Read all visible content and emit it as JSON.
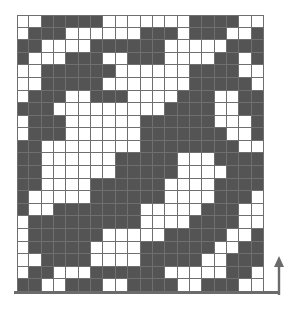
{
  "figure": {
    "type": "binary-grid-diagram",
    "title": ""
  },
  "colors": {
    "filled": "#545454",
    "empty": "#ffffff",
    "gridline": "#6f6f6f",
    "axis": "#6b6b6b",
    "background": "#ffffff"
  },
  "chart_data": {
    "type": "heatmap",
    "title": "",
    "xlabel": "",
    "ylabel": "",
    "legend": [],
    "grid": true,
    "columns": 20,
    "rows": 22,
    "value_labels": {
      "0": "empty",
      "1": "filled"
    },
    "matrix": [
      [
        0,
        0,
        1,
        1,
        1,
        1,
        1,
        0,
        0,
        0,
        0,
        0,
        0,
        0,
        1,
        1,
        1,
        1,
        0,
        0
      ],
      [
        0,
        1,
        1,
        1,
        0,
        0,
        0,
        0,
        0,
        0,
        1,
        1,
        1,
        0,
        1,
        1,
        1,
        0,
        0,
        1
      ],
      [
        1,
        1,
        0,
        0,
        0,
        0,
        1,
        1,
        1,
        1,
        1,
        1,
        0,
        0,
        0,
        0,
        0,
        1,
        1,
        1
      ],
      [
        1,
        0,
        0,
        0,
        1,
        1,
        1,
        0,
        0,
        1,
        1,
        1,
        0,
        0,
        0,
        0,
        1,
        1,
        0,
        1
      ],
      [
        0,
        0,
        1,
        1,
        1,
        1,
        1,
        1,
        0,
        0,
        0,
        0,
        0,
        0,
        1,
        1,
        1,
        1,
        0,
        0
      ],
      [
        0,
        0,
        1,
        1,
        1,
        1,
        1,
        0,
        0,
        0,
        0,
        0,
        0,
        0,
        1,
        1,
        1,
        1,
        1,
        0
      ],
      [
        0,
        1,
        1,
        1,
        0,
        0,
        1,
        1,
        1,
        0,
        0,
        0,
        0,
        1,
        1,
        1,
        0,
        0,
        1,
        1
      ],
      [
        1,
        1,
        1,
        0,
        0,
        0,
        0,
        0,
        0,
        0,
        0,
        0,
        1,
        1,
        1,
        1,
        0,
        0,
        1,
        1
      ],
      [
        0,
        1,
        1,
        1,
        0,
        0,
        0,
        0,
        0,
        0,
        1,
        1,
        1,
        1,
        1,
        1,
        0,
        0,
        0,
        1
      ],
      [
        0,
        1,
        1,
        1,
        0,
        0,
        0,
        0,
        0,
        0,
        1,
        1,
        1,
        1,
        1,
        1,
        1,
        0,
        0,
        1
      ],
      [
        1,
        1,
        0,
        0,
        0,
        0,
        0,
        0,
        0,
        0,
        1,
        1,
        1,
        1,
        1,
        1,
        1,
        1,
        0,
        0
      ],
      [
        1,
        1,
        0,
        0,
        0,
        0,
        0,
        0,
        1,
        1,
        1,
        1,
        1,
        0,
        0,
        0,
        1,
        1,
        1,
        1
      ],
      [
        1,
        1,
        0,
        0,
        0,
        0,
        0,
        0,
        1,
        1,
        1,
        1,
        1,
        0,
        0,
        0,
        0,
        1,
        1,
        1
      ],
      [
        1,
        1,
        0,
        0,
        0,
        0,
        1,
        1,
        1,
        1,
        1,
        1,
        0,
        0,
        0,
        0,
        1,
        1,
        1,
        1
      ],
      [
        1,
        0,
        0,
        0,
        0,
        0,
        1,
        1,
        1,
        1,
        1,
        1,
        0,
        0,
        0,
        0,
        1,
        1,
        1,
        0
      ],
      [
        1,
        0,
        0,
        1,
        1,
        1,
        1,
        1,
        1,
        1,
        0,
        0,
        0,
        0,
        0,
        1,
        1,
        1,
        0,
        0
      ],
      [
        0,
        1,
        1,
        1,
        1,
        1,
        1,
        1,
        1,
        1,
        0,
        0,
        0,
        0,
        1,
        1,
        1,
        1,
        0,
        0
      ],
      [
        0,
        1,
        1,
        1,
        1,
        1,
        1,
        0,
        0,
        0,
        0,
        0,
        1,
        1,
        1,
        1,
        1,
        0,
        0,
        1
      ],
      [
        0,
        1,
        1,
        1,
        1,
        1,
        0,
        0,
        0,
        0,
        1,
        1,
        1,
        1,
        1,
        1,
        0,
        0,
        1,
        1
      ],
      [
        0,
        0,
        1,
        1,
        1,
        1,
        0,
        0,
        0,
        0,
        1,
        1,
        1,
        1,
        1,
        0,
        0,
        1,
        1,
        1
      ],
      [
        0,
        1,
        1,
        0,
        0,
        0,
        1,
        1,
        1,
        1,
        1,
        1,
        0,
        0,
        0,
        0,
        0,
        1,
        1,
        0
      ],
      [
        1,
        1,
        0,
        0,
        1,
        1,
        1,
        0,
        0,
        1,
        1,
        1,
        1,
        0,
        0,
        1,
        1,
        1,
        0,
        0
      ]
    ]
  },
  "annotations": {
    "x_axis": {
      "name": "baseline",
      "label": ""
    },
    "y_arrow": {
      "name": "up-arrow",
      "label": "",
      "direction": "up"
    }
  }
}
